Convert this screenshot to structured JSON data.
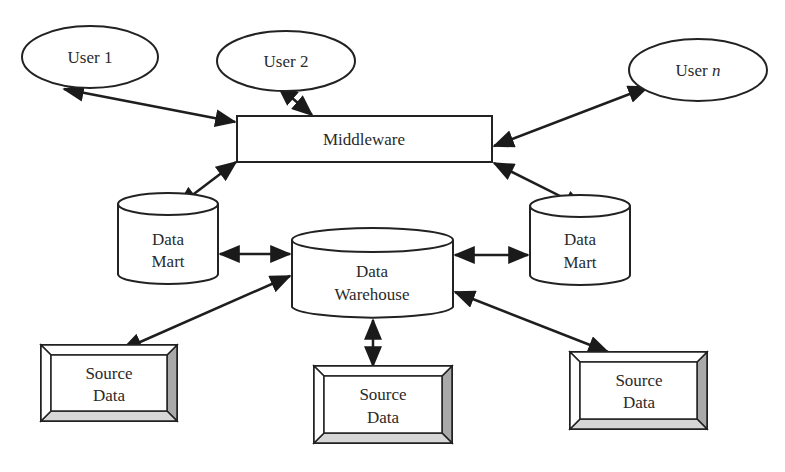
{
  "diagram": {
    "type": "data-warehouse-architecture",
    "colors": {
      "stroke": "#222222",
      "fill": "#ffffff",
      "bevel_dark": "#a9a9a9",
      "bevel_light": "#d6d6d6"
    },
    "nodes": {
      "user1": {
        "label": "User 1",
        "shape": "ellipse"
      },
      "user2": {
        "label": "User 2",
        "shape": "ellipse"
      },
      "usern": {
        "label_prefix": "User ",
        "label_var": "n",
        "shape": "ellipse"
      },
      "middleware": {
        "label": "Middleware",
        "shape": "rectangle"
      },
      "datamart_left": {
        "line1": "Data",
        "line2": "Mart",
        "shape": "cylinder"
      },
      "warehouse": {
        "line1": "Data",
        "line2": "Warehouse",
        "shape": "cylinder"
      },
      "datamart_right": {
        "line1": "Data",
        "line2": "Mart",
        "shape": "cylinder"
      },
      "source_left": {
        "line1": "Source",
        "line2": "Data",
        "shape": "beveled-box"
      },
      "source_center": {
        "line1": "Source",
        "line2": "Data",
        "shape": "beveled-box"
      },
      "source_right": {
        "line1": "Source",
        "line2": "Data",
        "shape": "beveled-box"
      }
    },
    "edges": [
      {
        "from": "User 1",
        "to": "Middleware",
        "direction": "bidirectional"
      },
      {
        "from": "User 2",
        "to": "Middleware",
        "direction": "bidirectional"
      },
      {
        "from": "User n",
        "to": "Middleware",
        "direction": "bidirectional"
      },
      {
        "from": "Middleware",
        "to": "Data Mart (left)",
        "direction": "bidirectional"
      },
      {
        "from": "Middleware",
        "to": "Data Mart (right)",
        "direction": "bidirectional"
      },
      {
        "from": "Data Mart (left)",
        "to": "Data Warehouse",
        "direction": "bidirectional"
      },
      {
        "from": "Data Warehouse",
        "to": "Data Mart (right)",
        "direction": "bidirectional"
      },
      {
        "from": "Data Warehouse",
        "to": "Source Data (left)",
        "direction": "bidirectional"
      },
      {
        "from": "Data Warehouse",
        "to": "Source Data (center)",
        "direction": "bidirectional"
      },
      {
        "from": "Data Warehouse",
        "to": "Source Data (right)",
        "direction": "bidirectional"
      }
    ]
  }
}
